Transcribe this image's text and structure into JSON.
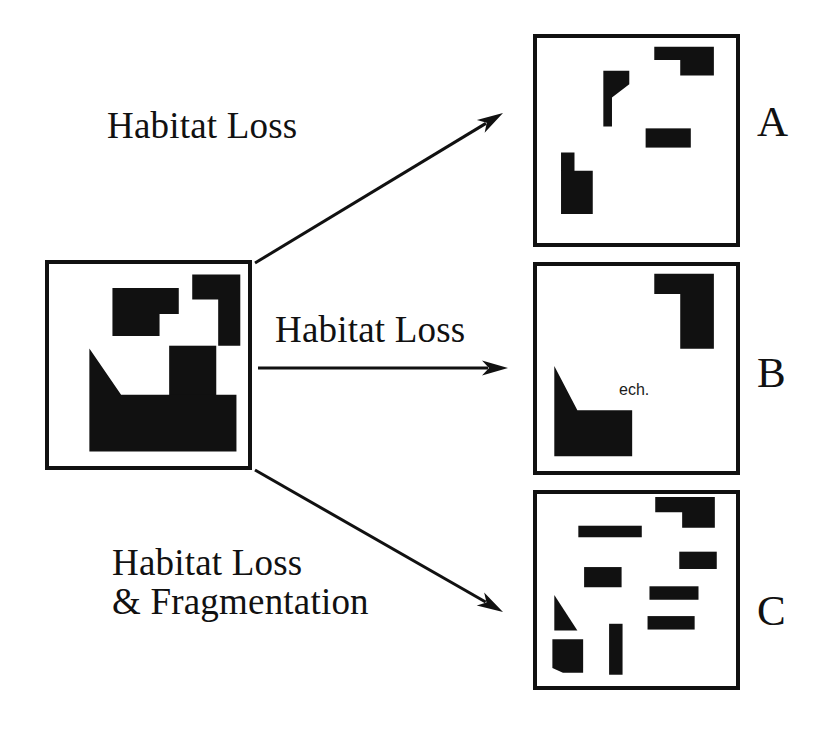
{
  "figure": {
    "background_color": "#ffffff",
    "patch_color": "#111111",
    "border_color": "#111111"
  },
  "source_panel": {
    "name": "original-landscape",
    "box": {
      "x": 45,
      "y": 260,
      "w": 207,
      "h": 210
    },
    "patches": [
      {
        "shape": "polygon",
        "points": "111,285 180,285 180,312 160,312 160,335 132,335 111,335"
      },
      {
        "shape": "polygon",
        "points": "194,271 244,271 244,345 221,345 221,297 194,297"
      },
      {
        "shape": "rect",
        "x": 170,
        "y": 345,
        "w": 49,
        "h": 58
      },
      {
        "shape": "polygon",
        "points": "87,348 87,455 240,455 240,396 120,396"
      }
    ]
  },
  "result_panels": [
    {
      "letter": "A",
      "name": "panel-a-habitat-loss",
      "box": {
        "x": 533,
        "y": 34,
        "w": 207,
        "h": 213
      },
      "letter_pos": {
        "x": 757,
        "y": 99
      },
      "patches": [
        {
          "shape": "polygon",
          "points": "655,43 717,43 717,73 682,73 682,57 655,57"
        },
        {
          "shape": "polygon",
          "points": "602,68 629,68 629,82 611,96 611,126 602,126"
        },
        {
          "shape": "rect",
          "x": 646,
          "y": 128,
          "w": 47,
          "h": 20
        },
        {
          "shape": "polygon",
          "points": "558,153 558,217 591,217 591,172 572,172 572,153"
        }
      ]
    },
    {
      "letter": "B",
      "name": "panel-b-habitat-loss",
      "box": {
        "x": 533,
        "y": 262,
        "w": 207,
        "h": 213
      },
      "letter_pos": {
        "x": 757,
        "y": 350
      },
      "note": {
        "text": "ech.",
        "x": 619,
        "y": 381
      },
      "patches": [
        {
          "shape": "polygon",
          "points": "655,270 717,270 717,348 682,348 682,291 655,291"
        },
        {
          "shape": "polygon",
          "points": "551,366 551,460 632,460 632,412 575,412"
        }
      ]
    },
    {
      "letter": "C",
      "name": "panel-c-habitat-loss-fragmentation",
      "box": {
        "x": 533,
        "y": 490,
        "w": 207,
        "h": 200
      },
      "letter_pos": {
        "x": 757,
        "y": 588
      },
      "patches": [
        {
          "shape": "polygon",
          "points": "656,493 718,493 718,525 684,525 684,509 656,509"
        },
        {
          "shape": "rect",
          "x": 576,
          "y": 523,
          "w": 66,
          "h": 12
        },
        {
          "shape": "rect",
          "x": 681,
          "y": 550,
          "w": 39,
          "h": 18
        },
        {
          "shape": "rect",
          "x": 582,
          "y": 566,
          "w": 39,
          "h": 21
        },
        {
          "shape": "rect",
          "x": 650,
          "y": 586,
          "w": 51,
          "h": 14
        },
        {
          "shape": "polygon",
          "points": "551,595 551,632 575,632"
        },
        {
          "shape": "rect",
          "x": 648,
          "y": 617,
          "w": 49,
          "h": 14
        },
        {
          "shape": "rect",
          "x": 608,
          "y": 625,
          "w": 14,
          "h": 53
        },
        {
          "shape": "polygon",
          "points": "549,641 581,641 581,676 560,676 549,671"
        }
      ]
    }
  ],
  "arrows": [
    {
      "name": "arrow-habitat-loss-top",
      "from": {
        "x": 255,
        "y": 263
      },
      "to": {
        "x": 503,
        "y": 113
      },
      "label": "Habitat Loss",
      "label_pos": {
        "x": 107,
        "y": 106
      },
      "label_lines": [
        "Habitat Loss"
      ]
    },
    {
      "name": "arrow-habitat-loss-middle",
      "from": {
        "x": 258,
        "y": 368
      },
      "to": {
        "x": 508,
        "y": 368
      },
      "label": "Habitat Loss",
      "label_pos": {
        "x": 275,
        "y": 310
      },
      "label_lines": [
        "Habitat Loss"
      ]
    },
    {
      "name": "arrow-habitat-loss-fragmentation-bottom",
      "from": {
        "x": 255,
        "y": 470
      },
      "to": {
        "x": 503,
        "y": 612
      },
      "label": "Habitat Loss\n& Fragmentation",
      "label_pos": {
        "x": 112,
        "y": 543
      },
      "label_lines": [
        "Habitat Loss",
        "& Fragmentation"
      ]
    }
  ]
}
